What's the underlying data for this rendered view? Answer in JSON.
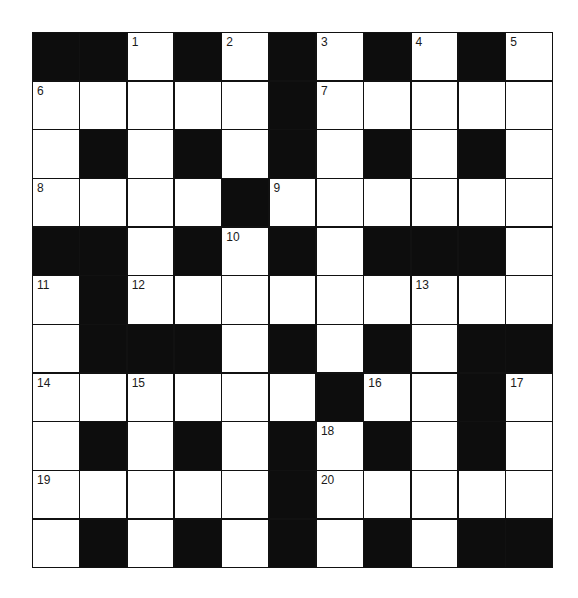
{
  "puzzle": {
    "type": "crossword",
    "rows": 11,
    "cols": 11,
    "colors": {
      "block": "#0d0d0d",
      "cell": "#ffffff",
      "line": "#111111"
    },
    "legend": "# = black square, . = white square, number = clue-numbered white square",
    "grid": [
      [
        "#",
        "#",
        "1",
        "#",
        "2",
        "#",
        "3",
        "#",
        "4",
        "#",
        "5"
      ],
      [
        "6",
        ".",
        ".",
        ".",
        ".",
        "#",
        "7",
        ".",
        ".",
        ".",
        "."
      ],
      [
        ".",
        "#",
        ".",
        "#",
        ".",
        "#",
        ".",
        "#",
        ".",
        "#",
        "."
      ],
      [
        "8",
        ".",
        ".",
        ".",
        "#",
        "9",
        ".",
        ".",
        ".",
        ".",
        "."
      ],
      [
        "#",
        "#",
        ".",
        "#",
        "10",
        "#",
        ".",
        "#",
        "#",
        "#",
        "."
      ],
      [
        "11",
        "#",
        "12",
        ".",
        ".",
        ".",
        ".",
        ".",
        "13",
        ".",
        "."
      ],
      [
        ".",
        "#",
        "#",
        "#",
        ".",
        "#",
        ".",
        "#",
        ".",
        "#",
        "#"
      ],
      [
        "14",
        ".",
        "15",
        ".",
        ".",
        ".",
        "#",
        "16",
        ".",
        "#",
        "17"
      ],
      [
        ".",
        "#",
        ".",
        "#",
        ".",
        "#",
        "18",
        "#",
        ".",
        "#",
        "."
      ],
      [
        "19",
        ".",
        ".",
        ".",
        ".",
        "#",
        "20",
        ".",
        ".",
        ".",
        "."
      ],
      [
        ".",
        "#",
        ".",
        "#",
        ".",
        "#",
        ".",
        "#",
        ".",
        "#",
        "#"
      ]
    ],
    "clue_numbers": [
      "1",
      "2",
      "3",
      "4",
      "5",
      "6",
      "7",
      "8",
      "9",
      "10",
      "11",
      "12",
      "13",
      "14",
      "15",
      "16",
      "17",
      "18",
      "19",
      "20"
    ]
  }
}
